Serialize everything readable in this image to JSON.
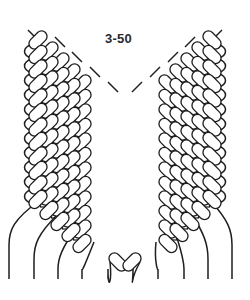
{
  "figure": {
    "label": "3-50"
  },
  "style": {
    "stroke_color": "#1e1e1e",
    "fill_color": "#ffffff",
    "background": "#ffffff"
  },
  "diagram": {
    "knot_rows": 12,
    "knots_per_row": 5,
    "cords_bottom_x": [
      9,
      34,
      58,
      82,
      108,
      133,
      158,
      184,
      208,
      232
    ],
    "cord_bottom_y": 279,
    "left_wing_origin": {
      "x": 38,
      "y": 40
    },
    "right_wing_origin": {
      "x": 212,
      "y": 40
    },
    "row_step_y": 14.5,
    "knot_step": {
      "dx": 11,
      "dy": 11
    },
    "knot_size": {
      "w": 21,
      "h": 11
    }
  }
}
